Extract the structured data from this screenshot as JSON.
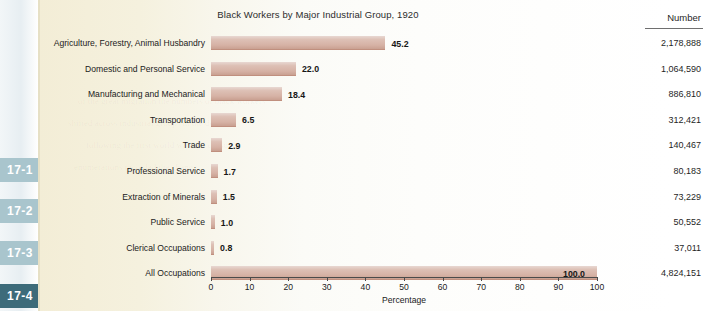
{
  "sidebar": {
    "tabs": [
      {
        "label": "17-1",
        "state": "inactive"
      },
      {
        "label": "17-2",
        "state": "inactive"
      },
      {
        "label": "17-3",
        "state": "inactive"
      },
      {
        "label": "17-4",
        "state": "active"
      }
    ],
    "active_color": "#3d6b7a",
    "inactive_color": "#a9c5cd"
  },
  "table": {
    "number_header": "Number",
    "numbers": [
      "2,178,888",
      "1,064,590",
      "886,810",
      "312,421",
      "140,467",
      "80,183",
      "73,229",
      "50,552",
      "37,011",
      "4,824,151"
    ]
  },
  "chart_data": {
    "type": "bar",
    "orientation": "horizontal",
    "title": "Black Workers by Major Industrial Group, 1920",
    "xlabel": "Percentage",
    "ylabel": "",
    "xlim": [
      0,
      100
    ],
    "xticks": [
      0,
      10,
      20,
      30,
      40,
      50,
      60,
      70,
      80,
      90,
      100
    ],
    "xticklabels": [
      "0",
      "10",
      "20",
      "30",
      "40",
      "50",
      "60",
      "70",
      "80",
      "90",
      "100"
    ],
    "grid": false,
    "legend": null,
    "bar_color": "#d6b2a5",
    "categories": [
      "Agriculture, Forestry, Animal Husbandry",
      "Domestic and Personal Service",
      "Manufacturing and Mechanical",
      "Transportation",
      "Trade",
      "Professional Service",
      "Extraction of Minerals",
      "Public Service",
      "Clerical Occupations",
      "All Occupations"
    ],
    "values": [
      45.2,
      22.0,
      18.4,
      6.5,
      2.9,
      1.7,
      1.5,
      1.0,
      0.8,
      100.0
    ],
    "value_labels": [
      "45.2",
      "22.0",
      "18.4",
      "6.5",
      "2.9",
      "1.7",
      "1.5",
      "1.0",
      "0.8",
      "100.0"
    ],
    "secondary_series": {
      "name": "Number",
      "values": [
        2178888,
        1064590,
        886810,
        312421,
        140467,
        80183,
        73229,
        50552,
        37011,
        4824151
      ],
      "labels": [
        "2,178,888",
        "1,064,590",
        "886,810",
        "312,421",
        "140,467",
        "80,183",
        "73,229",
        "50,552",
        "37,011",
        "4,824,151"
      ]
    }
  }
}
